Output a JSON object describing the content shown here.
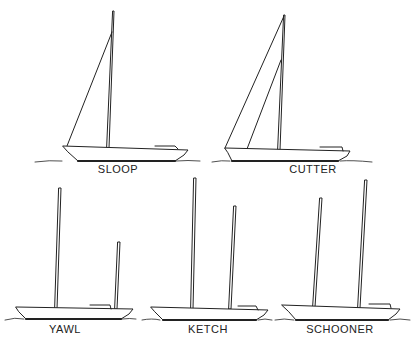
{
  "diagram": {
    "boats": [
      {
        "id": "sloop",
        "label": "SLOOP",
        "masts": 1,
        "headsails": 1
      },
      {
        "id": "cutter",
        "label": "CUTTER",
        "masts": 1,
        "headsails": 2
      },
      {
        "id": "yawl",
        "label": "YAWL",
        "masts": 2,
        "note": "small mizzen aft"
      },
      {
        "id": "ketch",
        "label": "KETCH",
        "masts": 2,
        "note": "taller mizzen"
      },
      {
        "id": "schooner",
        "label": "SCHOONER",
        "masts": 2,
        "note": "aft mast tallest"
      }
    ],
    "colors": {
      "line": "#222222",
      "background": "#ffffff"
    }
  }
}
